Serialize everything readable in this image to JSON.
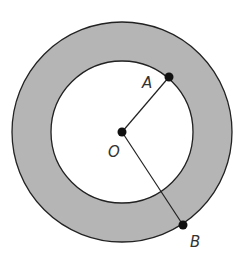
{
  "diagram": {
    "type": "annulus",
    "colors": {
      "ring_fill": "#b5b5b5",
      "stroke": "#222222",
      "inner_fill": "#ffffff"
    },
    "points": {
      "center": {
        "label": "O"
      },
      "inner_point": {
        "label": "A"
      },
      "outer_point": {
        "label": "B"
      }
    },
    "segments": [
      "OA",
      "OB"
    ]
  }
}
